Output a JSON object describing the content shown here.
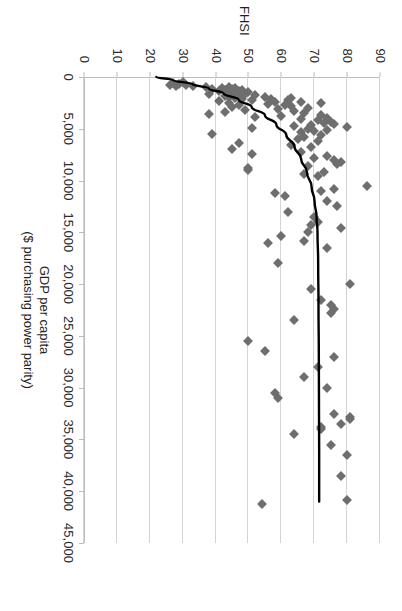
{
  "chart_data": {
    "type": "scatter",
    "title": "",
    "xlabel": "GDP per capita\n($ purchasing power parity)",
    "xlabel_line1": "GDP per capita",
    "xlabel_line2": "($ purchasing power parity)",
    "ylabel": "FHSI",
    "xlim": [
      0,
      45000
    ],
    "ylim": [
      0,
      90
    ],
    "grid": true,
    "legend": false,
    "marker_color": "#6e6e6e",
    "marker_shape": "diamond",
    "trendline_color": "#000000",
    "gridline_color": "#d4d4d4",
    "axis_color": "#bcbcbc",
    "xticks": [
      0,
      5000,
      10000,
      15000,
      20000,
      25000,
      30000,
      35000,
      40000,
      45000
    ],
    "xtick_labels": [
      "0",
      "5,000",
      "10,000",
      "15,000",
      "20,000",
      "25,000",
      "30,000",
      "35,000",
      "40,000",
      "45,000"
    ],
    "yticks": [
      0,
      10,
      20,
      30,
      40,
      50,
      60,
      70,
      80,
      90
    ],
    "ytick_labels": [
      "0",
      "10",
      "20",
      "30",
      "40",
      "50",
      "60",
      "70",
      "80",
      "90"
    ],
    "points": [
      [
        500,
        30
      ],
      [
        600,
        27
      ],
      [
        700,
        29
      ],
      [
        750,
        26
      ],
      [
        800,
        31
      ],
      [
        850,
        28
      ],
      [
        900,
        33
      ],
      [
        950,
        37
      ],
      [
        1000,
        44
      ],
      [
        1050,
        42
      ],
      [
        1100,
        46
      ],
      [
        1150,
        39
      ],
      [
        1200,
        45
      ],
      [
        1250,
        48
      ],
      [
        1300,
        43
      ],
      [
        1350,
        47
      ],
      [
        1400,
        41
      ],
      [
        1450,
        50
      ],
      [
        1500,
        44
      ],
      [
        1550,
        46
      ],
      [
        1600,
        38
      ],
      [
        1650,
        49
      ],
      [
        1700,
        45
      ],
      [
        1750,
        52
      ],
      [
        1800,
        43
      ],
      [
        1850,
        47
      ],
      [
        1900,
        55
      ],
      [
        1950,
        44
      ],
      [
        2000,
        63
      ],
      [
        2050,
        46
      ],
      [
        2100,
        57
      ],
      [
        2150,
        48
      ],
      [
        2200,
        62
      ],
      [
        2250,
        51
      ],
      [
        2300,
        41
      ],
      [
        2400,
        66
      ],
      [
        2450,
        58
      ],
      [
        2500,
        72
      ],
      [
        2550,
        44
      ],
      [
        2600,
        56
      ],
      [
        2700,
        61
      ],
      [
        2750,
        47
      ],
      [
        2800,
        63
      ],
      [
        2900,
        45
      ],
      [
        3000,
        68
      ],
      [
        3100,
        59
      ],
      [
        3200,
        49
      ],
      [
        3300,
        64
      ],
      [
        3400,
        43
      ],
      [
        3500,
        67
      ],
      [
        3600,
        38
      ],
      [
        3700,
        72
      ],
      [
        3800,
        60
      ],
      [
        3900,
        52
      ],
      [
        4000,
        74
      ],
      [
        4100,
        66
      ],
      [
        4200,
        71
      ],
      [
        4300,
        75
      ],
      [
        4400,
        73
      ],
      [
        4500,
        76
      ],
      [
        4600,
        69
      ],
      [
        4700,
        64
      ],
      [
        4800,
        80
      ],
      [
        4900,
        51
      ],
      [
        5000,
        68
      ],
      [
        5100,
        74
      ],
      [
        5200,
        70
      ],
      [
        5300,
        66
      ],
      [
        5500,
        39
      ],
      [
        5600,
        72
      ],
      [
        5800,
        67
      ],
      [
        6000,
        65
      ],
      [
        6200,
        71
      ],
      [
        6400,
        47
      ],
      [
        6600,
        63
      ],
      [
        6800,
        69
      ],
      [
        7000,
        45
      ],
      [
        7200,
        66
      ],
      [
        7400,
        51
      ],
      [
        7600,
        74
      ],
      [
        7800,
        70
      ],
      [
        8000,
        76
      ],
      [
        8200,
        78
      ],
      [
        8400,
        77
      ],
      [
        8600,
        68
      ],
      [
        8800,
        50
      ],
      [
        9000,
        50
      ],
      [
        9200,
        73
      ],
      [
        9400,
        67
      ],
      [
        9600,
        71
      ],
      [
        10500,
        86
      ],
      [
        10800,
        76
      ],
      [
        11000,
        72
      ],
      [
        11200,
        58
      ],
      [
        11500,
        61
      ],
      [
        12000,
        74
      ],
      [
        12500,
        77
      ],
      [
        13000,
        62
      ],
      [
        13500,
        70
      ],
      [
        14000,
        71
      ],
      [
        14300,
        69
      ],
      [
        14600,
        78
      ],
      [
        15000,
        68
      ],
      [
        15400,
        60
      ],
      [
        15800,
        67
      ],
      [
        16000,
        56
      ],
      [
        16500,
        74
      ],
      [
        18000,
        59
      ],
      [
        20000,
        81
      ],
      [
        20500,
        69
      ],
      [
        21500,
        72
      ],
      [
        22000,
        75
      ],
      [
        22400,
        76
      ],
      [
        22800,
        75
      ],
      [
        23500,
        64
      ],
      [
        25500,
        50
      ],
      [
        26500,
        55
      ],
      [
        27000,
        76
      ],
      [
        28000,
        71
      ],
      [
        29000,
        67
      ],
      [
        30000,
        74
      ],
      [
        30500,
        58
      ],
      [
        31000,
        59
      ],
      [
        32500,
        76
      ],
      [
        32800,
        81
      ],
      [
        33000,
        81
      ],
      [
        33500,
        78
      ],
      [
        33800,
        72
      ],
      [
        34000,
        72
      ],
      [
        34500,
        64
      ],
      [
        35500,
        75
      ],
      [
        36500,
        80
      ],
      [
        38500,
        78
      ],
      [
        40800,
        80
      ],
      [
        41200,
        54
      ]
    ],
    "trendline": {
      "description": "Logarithmic best fit: rises steeply from FHSI~22 at GDP~0, flattens near FHSI~71 beyond GDP~15,000",
      "x_start": 0,
      "x_end": 41000,
      "y_start": 22,
      "y_end": 71.5,
      "path_points": [
        [
          0,
          22
        ],
        [
          300,
          27
        ],
        [
          700,
          33
        ],
        [
          1100,
          38
        ],
        [
          1600,
          42.5
        ],
        [
          2200,
          47
        ],
        [
          2900,
          51
        ],
        [
          3700,
          55
        ],
        [
          4600,
          58.5
        ],
        [
          5600,
          61.5
        ],
        [
          6700,
          64
        ],
        [
          7900,
          66
        ],
        [
          9200,
          67.8
        ],
        [
          10600,
          69.2
        ],
        [
          12000,
          70.1
        ],
        [
          13500,
          70.7
        ],
        [
          15000,
          71.0
        ],
        [
          18000,
          71.2
        ],
        [
          22000,
          71.3
        ],
        [
          27000,
          71.4
        ],
        [
          32000,
          71.45
        ],
        [
          36000,
          71.5
        ],
        [
          41000,
          71.5
        ]
      ]
    }
  }
}
